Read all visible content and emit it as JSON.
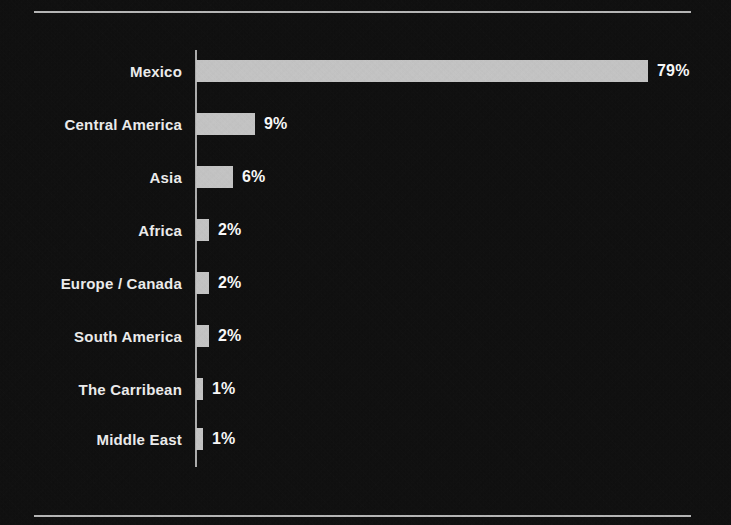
{
  "chart_data": {
    "type": "bar",
    "orientation": "horizontal",
    "title": "",
    "subtitle": "",
    "xlabel": "",
    "ylabel": "",
    "grid": false,
    "legend": false,
    "axis_tick_labels": [],
    "value_suffix": "%",
    "categories": [
      "Mexico",
      "Central America",
      "Asia",
      "Africa",
      "Europe / Canada",
      "South America",
      "The Carribean",
      "Middle East"
    ],
    "values": [
      79,
      9,
      6,
      2,
      2,
      2,
      1,
      1
    ],
    "value_labels": [
      "79%",
      "9%",
      "6%",
      "2%",
      "2%",
      "2%",
      "1%",
      "1%"
    ],
    "xlim": [
      0,
      79
    ],
    "colors": {
      "background": "#0e0e0e",
      "bar_fill": "#c8c8c8",
      "axis_line": "#b0b0b0",
      "rule": "#b9b9b9",
      "label_text": "#f2f2f2",
      "value_text": "#ffffff"
    }
  },
  "rows": [
    {
      "label": "Mexico",
      "value_label": "79%",
      "bar_width": 452,
      "top": 60
    },
    {
      "label": "Central America",
      "value_label": "9%",
      "bar_width": 59,
      "top": 113
    },
    {
      "label": "Asia",
      "value_label": "6%",
      "bar_width": 37,
      "top": 166
    },
    {
      "label": "Africa",
      "value_label": "2%",
      "bar_width": 13,
      "top": 219
    },
    {
      "label": "Europe / Canada",
      "value_label": "2%",
      "bar_width": 13,
      "top": 272
    },
    {
      "label": "South America",
      "value_label": "2%",
      "bar_width": 13,
      "top": 325
    },
    {
      "label": "The Carribean",
      "value_label": "1%",
      "bar_width": 7,
      "top": 378
    },
    {
      "label": "Middle East",
      "value_label": "1%",
      "bar_width": 7,
      "top": 428
    }
  ]
}
